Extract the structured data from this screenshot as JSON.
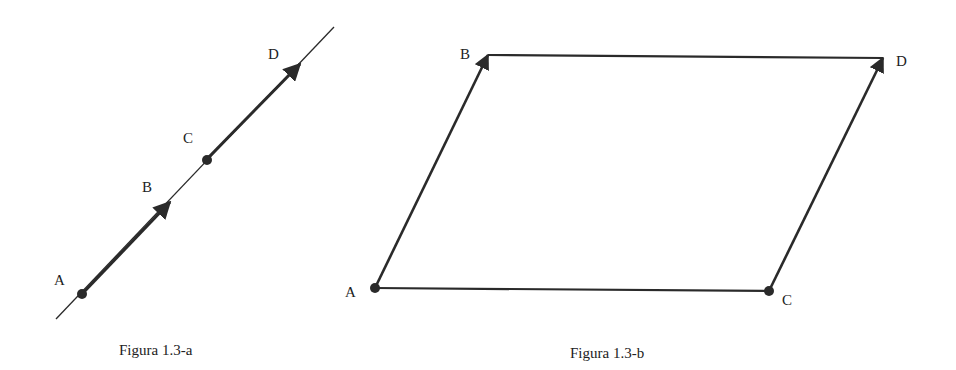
{
  "figure_a": {
    "caption": "Figura 1.3-a",
    "points": {
      "A": "A",
      "B": "B",
      "C": "C",
      "D": "D"
    }
  },
  "figure_b": {
    "caption": "Figura 1.3-b",
    "points": {
      "A": "A",
      "B": "B",
      "C": "C",
      "D": "D"
    }
  },
  "colors": {
    "stroke": "#2a2a2a",
    "background": "#ffffff"
  }
}
